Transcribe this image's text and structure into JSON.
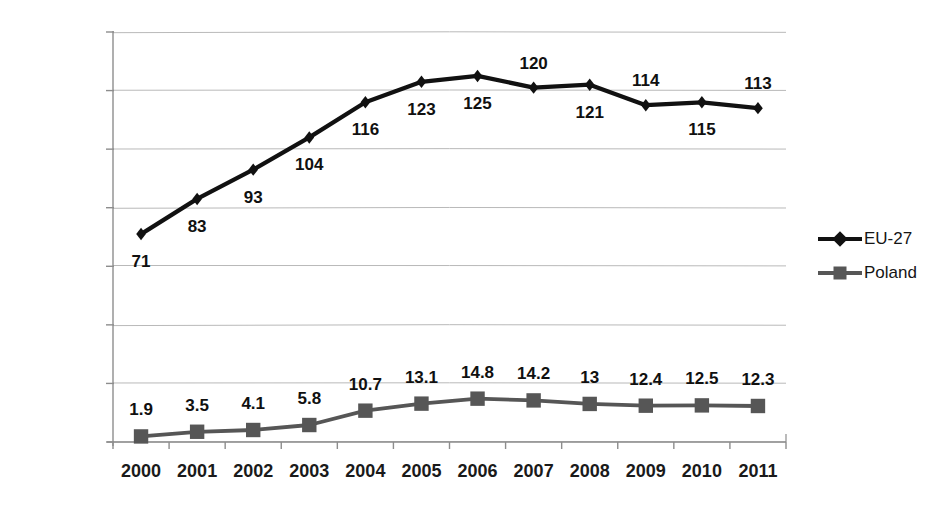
{
  "chart_data": {
    "type": "line",
    "title": "",
    "xlabel": "",
    "ylabel": "Thousands",
    "categories": [
      "2000",
      "2001",
      "2002",
      "2003",
      "2004",
      "2005",
      "2006",
      "2007",
      "2008",
      "2009",
      "2010",
      "2011"
    ],
    "ylim": [
      0,
      140
    ],
    "ytick_values": [
      0,
      20,
      40,
      60,
      80,
      100,
      120,
      140
    ],
    "ytick_labels": [
      "0",
      "20",
      "40",
      "60",
      "80",
      "100",
      "120",
      "140"
    ],
    "grid": true,
    "legend_position": "right",
    "series": [
      {
        "name": "EU-27",
        "marker": "diamond",
        "color": "#111111",
        "values": [
          71,
          83,
          93,
          104,
          116,
          123,
          125,
          121,
          122,
          115,
          116,
          114
        ],
        "labels": [
          "71",
          "83",
          "93",
          "104",
          "116",
          "123",
          "125",
          "120",
          "121",
          "114",
          "115",
          "113"
        ],
        "label_positions": [
          "below",
          "below",
          "below",
          "below",
          "below",
          "below",
          "below",
          "above",
          "below",
          "above",
          "below",
          "above"
        ]
      },
      {
        "name": "Poland",
        "marker": "square",
        "color": "#565656",
        "values": [
          1.9,
          3.5,
          4.1,
          5.8,
          10.7,
          13.1,
          14.8,
          14.2,
          13,
          12.4,
          12.5,
          12.3
        ],
        "labels": [
          "1.9",
          "3.5",
          "4.1",
          "5.8",
          "10.7",
          "13.1",
          "14.8",
          "14.2",
          "13",
          "12.4",
          "12.5",
          "12.3"
        ],
        "label_positions": [
          "above",
          "above",
          "above",
          "above",
          "above",
          "above",
          "above",
          "above",
          "above",
          "above",
          "above",
          "above"
        ]
      }
    ],
    "legend": [
      {
        "label": "EU-27",
        "marker": "diamond",
        "color": "#111111"
      },
      {
        "label": "Poland",
        "marker": "square",
        "color": "#565656"
      }
    ]
  },
  "axis_title": "Thousands"
}
